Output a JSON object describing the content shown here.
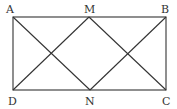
{
  "diagram": {
    "labels": {
      "A": "A",
      "B": "B",
      "C": "C",
      "D": "D",
      "M": "M",
      "N": "N"
    },
    "stroke_color": "#333333"
  }
}
